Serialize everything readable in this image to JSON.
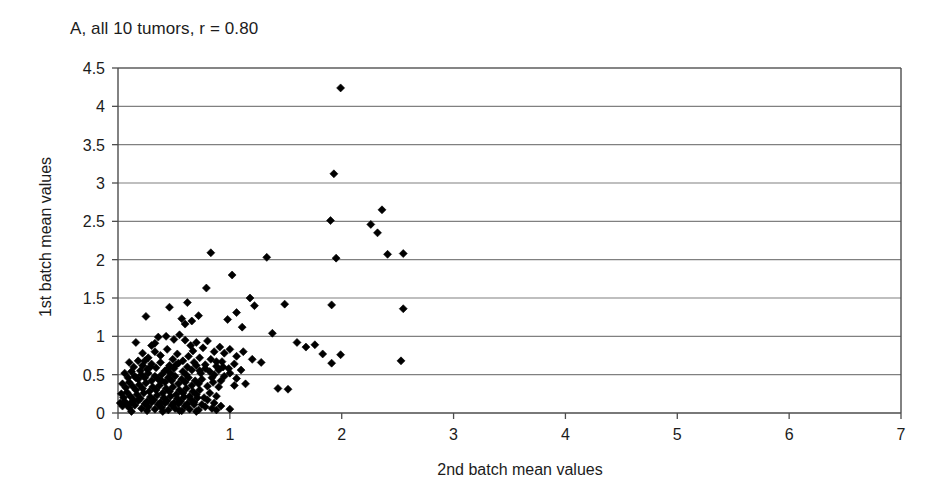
{
  "chart_data": {
    "type": "scatter",
    "title": "A, all 10 tumors, r = 0.80",
    "xlabel": "2nd batch mean values",
    "ylabel": "1st batch mean values",
    "correlation_r": 0.8,
    "group_label": "A",
    "n_tumors": 10,
    "xlim": [
      0,
      7
    ],
    "ylim": [
      0,
      4.5
    ],
    "xticks": [
      "0",
      "1",
      "2",
      "3",
      "4",
      "5",
      "6",
      "7"
    ],
    "xtick_values": [
      0,
      1,
      2,
      3,
      4,
      5,
      6,
      7
    ],
    "yticks": [
      "0",
      "0.5",
      "1",
      "1.5",
      "2",
      "2.5",
      "3",
      "3.5",
      "4",
      "4.5"
    ],
    "ytick_values": [
      0,
      0.5,
      1,
      1.5,
      2,
      2.5,
      3,
      3.5,
      4,
      4.5
    ],
    "grid": "horizontal",
    "legend": "none",
    "marker": "diamond",
    "marker_color": "#000000",
    "marker_size_px": 8,
    "axis_color": "#4d4d4d",
    "gridline_color": "#808080",
    "background_color": "#ffffff",
    "points": [
      [
        1.99,
        4.24
      ],
      [
        1.93,
        3.12
      ],
      [
        1.9,
        2.51
      ],
      [
        2.36,
        2.65
      ],
      [
        2.26,
        2.46
      ],
      [
        2.32,
        2.35
      ],
      [
        1.95,
        2.02
      ],
      [
        2.41,
        2.07
      ],
      [
        2.55,
        2.08
      ],
      [
        0.83,
        2.09
      ],
      [
        1.33,
        2.03
      ],
      [
        2.55,
        1.36
      ],
      [
        2.53,
        0.68
      ],
      [
        0.79,
        1.63
      ],
      [
        1.02,
        1.8
      ],
      [
        1.18,
        1.5
      ],
      [
        1.22,
        1.4
      ],
      [
        1.49,
        1.42
      ],
      [
        1.91,
        1.41
      ],
      [
        0.62,
        1.44
      ],
      [
        0.46,
        1.38
      ],
      [
        0.25,
        1.26
      ],
      [
        1.06,
        1.31
      ],
      [
        0.98,
        1.22
      ],
      [
        1.11,
        1.12
      ],
      [
        0.72,
        1.27
      ],
      [
        0.66,
        1.2
      ],
      [
        0.6,
        1.16
      ],
      [
        0.57,
        1.23
      ],
      [
        1.38,
        1.04
      ],
      [
        1.6,
        0.92
      ],
      [
        1.68,
        0.86
      ],
      [
        1.76,
        0.89
      ],
      [
        1.83,
        0.77
      ],
      [
        1.99,
        0.76
      ],
      [
        1.91,
        0.65
      ],
      [
        1.52,
        0.31
      ],
      [
        1.43,
        0.32
      ],
      [
        0.16,
        0.92
      ],
      [
        0.3,
        0.88
      ],
      [
        0.36,
        0.99
      ],
      [
        0.43,
        1.0
      ],
      [
        0.5,
        0.96
      ],
      [
        0.55,
        1.02
      ],
      [
        0.6,
        0.95
      ],
      [
        0.65,
        0.88
      ],
      [
        0.7,
        0.92
      ],
      [
        0.76,
        0.85
      ],
      [
        0.8,
        0.94
      ],
      [
        0.86,
        0.8
      ],
      [
        0.91,
        0.86
      ],
      [
        0.95,
        0.78
      ],
      [
        1.0,
        0.83
      ],
      [
        1.06,
        0.74
      ],
      [
        1.12,
        0.8
      ],
      [
        1.2,
        0.7
      ],
      [
        1.28,
        0.66
      ],
      [
        0.22,
        0.78
      ],
      [
        0.27,
        0.72
      ],
      [
        0.33,
        0.8
      ],
      [
        0.38,
        0.75
      ],
      [
        0.44,
        0.83
      ],
      [
        0.49,
        0.7
      ],
      [
        0.53,
        0.77
      ],
      [
        0.58,
        0.68
      ],
      [
        0.63,
        0.74
      ],
      [
        0.68,
        0.66
      ],
      [
        0.73,
        0.72
      ],
      [
        0.78,
        0.63
      ],
      [
        0.83,
        0.7
      ],
      [
        0.88,
        0.61
      ],
      [
        0.93,
        0.67
      ],
      [
        0.99,
        0.58
      ],
      [
        1.04,
        0.64
      ],
      [
        1.1,
        0.56
      ],
      [
        0.1,
        0.66
      ],
      [
        0.14,
        0.6
      ],
      [
        0.18,
        0.68
      ],
      [
        0.22,
        0.62
      ],
      [
        0.26,
        0.57
      ],
      [
        0.3,
        0.64
      ],
      [
        0.34,
        0.59
      ],
      [
        0.38,
        0.66
      ],
      [
        0.42,
        0.55
      ],
      [
        0.46,
        0.62
      ],
      [
        0.5,
        0.58
      ],
      [
        0.54,
        0.65
      ],
      [
        0.58,
        0.54
      ],
      [
        0.62,
        0.6
      ],
      [
        0.66,
        0.56
      ],
      [
        0.7,
        0.62
      ],
      [
        0.74,
        0.52
      ],
      [
        0.78,
        0.58
      ],
      [
        0.82,
        0.54
      ],
      [
        0.86,
        0.5
      ],
      [
        0.9,
        0.56
      ],
      [
        0.95,
        0.48
      ],
      [
        1.0,
        0.52
      ],
      [
        0.06,
        0.52
      ],
      [
        0.09,
        0.46
      ],
      [
        0.12,
        0.54
      ],
      [
        0.15,
        0.48
      ],
      [
        0.18,
        0.44
      ],
      [
        0.21,
        0.5
      ],
      [
        0.24,
        0.46
      ],
      [
        0.27,
        0.52
      ],
      [
        0.3,
        0.42
      ],
      [
        0.33,
        0.48
      ],
      [
        0.36,
        0.44
      ],
      [
        0.39,
        0.5
      ],
      [
        0.42,
        0.4
      ],
      [
        0.45,
        0.46
      ],
      [
        0.48,
        0.42
      ],
      [
        0.51,
        0.48
      ],
      [
        0.54,
        0.38
      ],
      [
        0.57,
        0.44
      ],
      [
        0.6,
        0.4
      ],
      [
        0.63,
        0.46
      ],
      [
        0.66,
        0.36
      ],
      [
        0.69,
        0.42
      ],
      [
        0.72,
        0.38
      ],
      [
        0.75,
        0.44
      ],
      [
        0.8,
        0.35
      ],
      [
        0.85,
        0.4
      ],
      [
        0.9,
        0.34
      ],
      [
        0.04,
        0.38
      ],
      [
        0.07,
        0.33
      ],
      [
        0.1,
        0.4
      ],
      [
        0.13,
        0.35
      ],
      [
        0.16,
        0.3
      ],
      [
        0.19,
        0.37
      ],
      [
        0.22,
        0.32
      ],
      [
        0.25,
        0.39
      ],
      [
        0.28,
        0.28
      ],
      [
        0.31,
        0.34
      ],
      [
        0.34,
        0.3
      ],
      [
        0.37,
        0.36
      ],
      [
        0.4,
        0.26
      ],
      [
        0.43,
        0.32
      ],
      [
        0.46,
        0.28
      ],
      [
        0.49,
        0.34
      ],
      [
        0.52,
        0.24
      ],
      [
        0.55,
        0.3
      ],
      [
        0.58,
        0.26
      ],
      [
        0.61,
        0.32
      ],
      [
        0.64,
        0.22
      ],
      [
        0.67,
        0.28
      ],
      [
        0.7,
        0.24
      ],
      [
        0.73,
        0.3
      ],
      [
        0.77,
        0.2
      ],
      [
        0.82,
        0.26
      ],
      [
        0.88,
        0.22
      ],
      [
        0.03,
        0.25
      ],
      [
        0.05,
        0.2
      ],
      [
        0.08,
        0.27
      ],
      [
        0.11,
        0.22
      ],
      [
        0.14,
        0.17
      ],
      [
        0.17,
        0.24
      ],
      [
        0.2,
        0.19
      ],
      [
        0.23,
        0.26
      ],
      [
        0.26,
        0.15
      ],
      [
        0.29,
        0.21
      ],
      [
        0.32,
        0.17
      ],
      [
        0.35,
        0.23
      ],
      [
        0.38,
        0.14
      ],
      [
        0.41,
        0.2
      ],
      [
        0.44,
        0.16
      ],
      [
        0.47,
        0.22
      ],
      [
        0.5,
        0.13
      ],
      [
        0.53,
        0.19
      ],
      [
        0.56,
        0.15
      ],
      [
        0.59,
        0.21
      ],
      [
        0.62,
        0.12
      ],
      [
        0.65,
        0.18
      ],
      [
        0.68,
        0.14
      ],
      [
        0.71,
        0.2
      ],
      [
        0.75,
        0.11
      ],
      [
        0.8,
        0.17
      ],
      [
        0.86,
        0.13
      ],
      [
        0.02,
        0.13
      ],
      [
        0.04,
        0.09
      ],
      [
        0.06,
        0.15
      ],
      [
        0.08,
        0.11
      ],
      [
        0.1,
        0.07
      ],
      [
        0.12,
        0.14
      ],
      [
        0.15,
        0.1
      ],
      [
        0.18,
        0.16
      ],
      [
        0.21,
        0.06
      ],
      [
        0.24,
        0.12
      ],
      [
        0.27,
        0.08
      ],
      [
        0.3,
        0.14
      ],
      [
        0.33,
        0.05
      ],
      [
        0.36,
        0.11
      ],
      [
        0.39,
        0.07
      ],
      [
        0.42,
        0.13
      ],
      [
        0.45,
        0.04
      ],
      [
        0.48,
        0.1
      ],
      [
        0.51,
        0.06
      ],
      [
        0.54,
        0.12
      ],
      [
        0.57,
        0.03
      ],
      [
        0.6,
        0.09
      ],
      [
        0.64,
        0.05
      ],
      [
        0.68,
        0.11
      ],
      [
        0.72,
        0.04
      ],
      [
        0.78,
        0.08
      ],
      [
        0.84,
        0.06
      ],
      [
        0.92,
        0.09
      ],
      [
        1.0,
        0.05
      ],
      [
        0.12,
        0.02
      ],
      [
        0.26,
        0.03
      ],
      [
        0.4,
        0.02
      ],
      [
        0.55,
        0.03
      ],
      [
        0.7,
        0.02
      ],
      [
        0.88,
        0.04
      ],
      [
        0.16,
        0.46
      ],
      [
        0.2,
        0.55
      ],
      [
        0.24,
        0.68
      ],
      [
        0.44,
        0.57
      ],
      [
        0.52,
        0.63
      ],
      [
        0.67,
        0.81
      ],
      [
        0.73,
        0.55
      ],
      [
        0.88,
        0.67
      ],
      [
        0.94,
        0.6
      ],
      [
        1.06,
        0.45
      ],
      [
        1.14,
        0.38
      ],
      [
        0.33,
        0.91
      ],
      [
        0.47,
        0.52
      ],
      [
        0.29,
        0.6
      ],
      [
        0.61,
        0.5
      ],
      [
        0.39,
        0.42
      ],
      [
        0.84,
        0.46
      ],
      [
        0.92,
        0.42
      ],
      [
        1.04,
        0.36
      ]
    ]
  }
}
